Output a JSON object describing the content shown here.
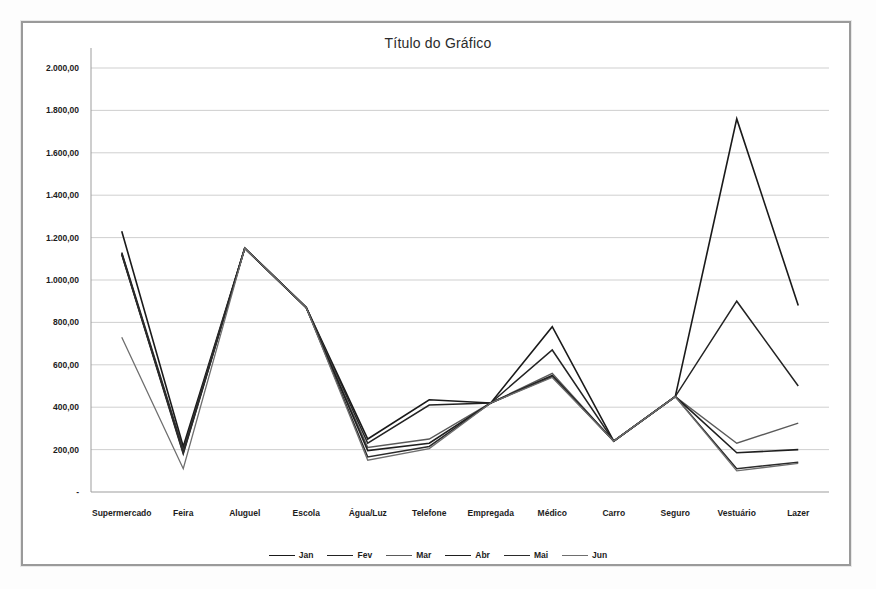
{
  "chart_data": {
    "type": "line",
    "title": "Título do Gráfico",
    "xlabel": "",
    "ylabel": "",
    "ylim": [
      0,
      2000
    ],
    "ytick_step": 200,
    "grid": true,
    "legend_position": "bottom",
    "ytick_labels": [
      "-",
      "200,00",
      "400,00",
      "600,00",
      "800,00",
      "1.000,00",
      "1.200,00",
      "1.400,00",
      "1.600,00",
      "1.800,00",
      "2.000,00"
    ],
    "ytick_values": [
      0,
      200,
      400,
      600,
      800,
      1000,
      1200,
      1400,
      1600,
      1800,
      2000
    ],
    "categories": [
      "Supermercado",
      "Feira",
      "Aluguel",
      "Escola",
      "Água/Luz",
      "Telefone",
      "Empregada",
      "Médico",
      "Carro",
      "Seguro",
      "Vestuário",
      "Lazer"
    ],
    "series": [
      {
        "name": "Jan",
        "color": "#1a1a1a",
        "width": 1.6,
        "values": [
          1230,
          215,
          1150,
          870,
          250,
          435,
          420,
          780,
          240,
          450,
          1760,
          880
        ]
      },
      {
        "name": "Fev",
        "color": "#232323",
        "width": 1.5,
        "values": [
          1130,
          200,
          1150,
          870,
          230,
          410,
          420,
          670,
          240,
          450,
          900,
          500
        ]
      },
      {
        "name": "Mar",
        "color": "#5a5a5a",
        "width": 1.4,
        "values": [
          1120,
          190,
          1150,
          870,
          210,
          250,
          420,
          560,
          240,
          450,
          230,
          325
        ]
      },
      {
        "name": "Abr",
        "color": "#1f1f1f",
        "width": 1.6,
        "values": [
          1125,
          185,
          1150,
          870,
          195,
          230,
          420,
          550,
          240,
          450,
          185,
          200
        ]
      },
      {
        "name": "Mai",
        "color": "#2b2b2b",
        "width": 1.5,
        "values": [
          1120,
          180,
          1150,
          870,
          165,
          215,
          420,
          545,
          240,
          450,
          110,
          140
        ]
      },
      {
        "name": "Jun",
        "color": "#6e6e6e",
        "width": 1.3,
        "values": [
          730,
          110,
          1150,
          870,
          150,
          205,
          420,
          540,
          240,
          450,
          100,
          135
        ]
      }
    ]
  },
  "legend": {
    "items": [
      {
        "label": "Jan"
      },
      {
        "label": "Fev"
      },
      {
        "label": "Mar"
      },
      {
        "label": "Abr"
      },
      {
        "label": "Mai"
      },
      {
        "label": "Jun"
      }
    ]
  }
}
